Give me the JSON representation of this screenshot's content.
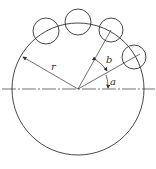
{
  "diagram": {
    "type": "geometry",
    "labels": {
      "radius": "r",
      "angle_pitch": "b",
      "angle_start": "a"
    },
    "colors": {
      "stroke": "#333333",
      "background": "#ffffff"
    },
    "main_circle": {
      "cx": 78,
      "cy": 89,
      "r": 66
    },
    "small_circles": [
      {
        "cx": 46,
        "cy": 31,
        "r": 13
      },
      {
        "cx": 78,
        "cy": 22,
        "r": 13
      },
      {
        "cx": 111,
        "cy": 30,
        "r": 12
      },
      {
        "cx": 134,
        "cy": 57,
        "r": 12
      }
    ]
  }
}
